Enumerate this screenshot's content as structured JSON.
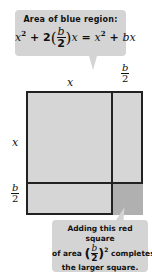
{
  "top_callout": {
    "heading": "Area of blue region:",
    "equation": {
      "term1": "x",
      "term1_exp": "2",
      "plus1": " + ",
      "coef": "2",
      "frac_num": "b",
      "frac_den": "2",
      "var": "x",
      "equals": " = ",
      "rhs1": "x",
      "rhs1_exp": "2",
      "plus2": " + ",
      "rhs2": "bx"
    }
  },
  "labels": {
    "top_x": "x",
    "top_b_num": "b",
    "top_b_den": "2",
    "left_x": "x",
    "left_b_num": "b",
    "left_b_den": "2"
  },
  "bottom_callout": {
    "line1": "Adding this red square",
    "line2_pre": "of area ",
    "frac_num": "b",
    "frac_den": "2",
    "exp": "2",
    "line2_post": " completes",
    "line3": "the larger square."
  },
  "colors": {
    "callout_bg": "#d4d4d4",
    "region_fill": "#d6d6d6",
    "small_square_fill": "#b0b0b0",
    "border": "#222222"
  }
}
